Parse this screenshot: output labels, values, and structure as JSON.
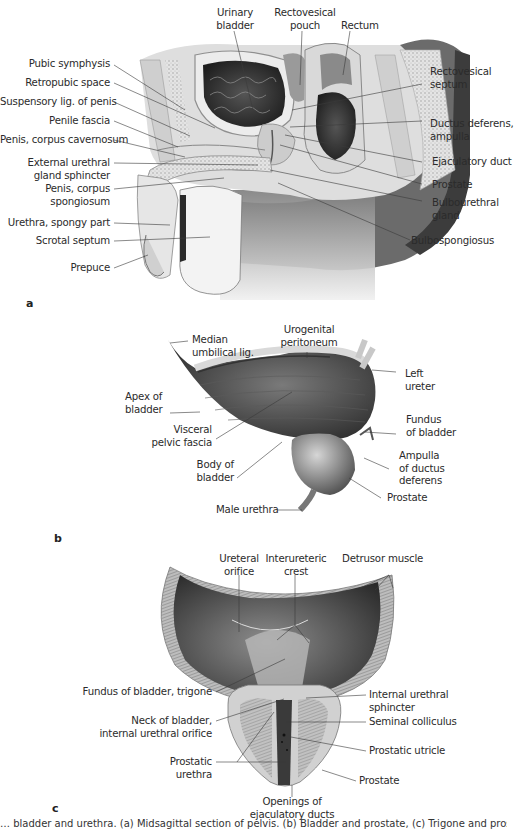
{
  "figure": {
    "panels": [
      {
        "letter": "a",
        "labels_left": [
          "Pubic symphysis",
          "Retropubic space",
          "Suspensory lig. of penis",
          "Penile fascia",
          "Penis, corpus cavernosum",
          "External urethral",
          "gland sphincter",
          "Penis, corpus",
          "spongiosum",
          "Urethra, spongy part",
          "Scrotal septum",
          "Prepuce"
        ],
        "labels_top": [
          {
            "line1": "Urinary",
            "line2": "bladder"
          },
          {
            "line1": "Rectovesical",
            "line2": "pouch"
          },
          {
            "line1": "Rectum",
            "line2": ""
          }
        ],
        "labels_right": [
          {
            "line1": "Rectovesical",
            "line2": "septum"
          },
          {
            "line1": "Ductus deferens,",
            "line2": "ampulla"
          },
          {
            "line1": "Ejaculatory duct",
            "line2": ""
          },
          {
            "line1": "Prostate",
            "line2": ""
          },
          {
            "line1": "Bulbourethral",
            "line2": "gland"
          },
          {
            "line1": "Bulbospongiosus",
            "line2": ""
          }
        ]
      },
      {
        "letter": "b",
        "labels": {
          "median_umbilical": {
            "line1": "Median",
            "line2": "umbilical lig."
          },
          "urogenital_peritoneum": {
            "line1": "Urogenital",
            "line2": "peritoneum"
          },
          "left_ureter": {
            "line1": "Left",
            "line2": "ureter"
          },
          "apex": {
            "line1": "Apex of",
            "line2": "bladder"
          },
          "visceral_fascia": {
            "line1": "Visceral",
            "line2": "pelvic fascia"
          },
          "fundus": {
            "line1": "Fundus",
            "line2": "of bladder"
          },
          "body": {
            "line1": "Body of",
            "line2": "bladder"
          },
          "ampulla": {
            "line1": "Ampulla",
            "line2": "of ductus",
            "line3": "deferens"
          },
          "prostate": {
            "line1": "Prostate"
          },
          "male_urethra": {
            "line1": "Male urethra"
          }
        }
      },
      {
        "letter": "c",
        "labels": {
          "ureteral_orifice": {
            "line1": "Ureteral",
            "line2": "orifice"
          },
          "interureteric_crest": {
            "line1": "Interureteric",
            "line2": "crest"
          },
          "detrusor": {
            "line1": "Detrusor muscle"
          },
          "fundus_trigone": {
            "line1": "Fundus of bladder, trigone"
          },
          "neck": {
            "line1": "Neck of bladder,",
            "line2": "internal urethral orifice"
          },
          "prostatic_urethra": {
            "line1": "Prostatic",
            "line2": "urethra"
          },
          "internal_sphincter": {
            "line1": "Internal urethral",
            "line2": "sphincter"
          },
          "seminal_colliculus": {
            "line1": "Seminal colliculus"
          },
          "prostatic_utricle": {
            "line1": "Prostatic utricle"
          },
          "prostate": {
            "line1": "Prostate"
          },
          "openings": {
            "line1": "Openings of",
            "line2": "ejaculatory ducts"
          }
        }
      }
    ],
    "caption_fragment": "… bladder and urethra. (a) Midsagittal section of pelvis. (b) Bladder and prostate, (c) Trigone and prostatic urethra …"
  }
}
